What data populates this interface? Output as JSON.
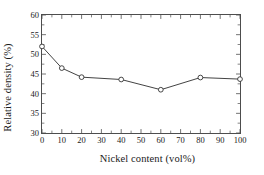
{
  "chart_data": {
    "type": "line",
    "title": "",
    "xlabel": "Nickel content (vol%)",
    "ylabel": "Relative density (%)",
    "x": [
      0,
      10,
      20,
      40,
      60,
      80,
      100
    ],
    "values": [
      52.0,
      46.5,
      44.2,
      43.6,
      41.0,
      44.1,
      43.7
    ],
    "series": [
      {
        "name": "Relative density",
        "x": [
          0,
          10,
          20,
          40,
          60,
          80,
          100
        ],
        "values": [
          52.0,
          46.5,
          44.2,
          43.6,
          41.0,
          44.1,
          43.7
        ]
      }
    ],
    "xlim": [
      0,
      100
    ],
    "ylim": [
      30,
      60
    ],
    "xticks": [
      0,
      10,
      20,
      30,
      40,
      50,
      60,
      70,
      80,
      90,
      100
    ],
    "yticks": [
      30,
      35,
      40,
      45,
      50,
      55,
      60
    ],
    "xtick_labels": [
      "0",
      "10",
      "20",
      "30",
      "40",
      "50",
      "60",
      "70",
      "80",
      "90",
      "100"
    ],
    "ytick_labels": [
      "30",
      "35",
      "40",
      "45",
      "50",
      "55",
      "60"
    ],
    "grid": false,
    "legend": null,
    "marker": "open-circle",
    "line_color": "#404040",
    "marker_face_color": "#ffffff",
    "marker_edge_color": "#333333",
    "axis_color": "#4d4d4d",
    "tick_direction": "in",
    "frame": "box"
  }
}
